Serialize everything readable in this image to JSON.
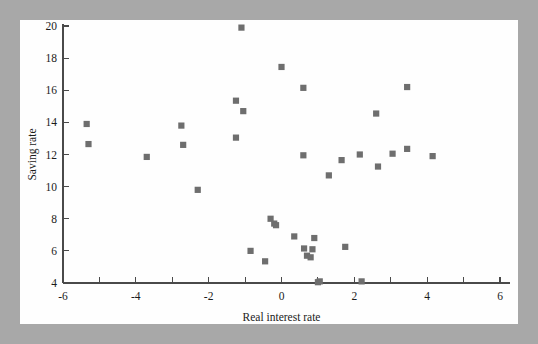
{
  "figure": {
    "background_color": "#a8a8a8",
    "card_color": "#fefefe",
    "marker_color": "#6e6e6e",
    "axis_color": "#4a4a4a"
  },
  "chart_data": {
    "type": "scatter",
    "title": "",
    "xlabel": "Real interest rate",
    "ylabel": "Saving rate",
    "xlim": [
      -6,
      6
    ],
    "ylim": [
      4,
      20
    ],
    "xticks": [
      -6,
      -4,
      -2,
      0,
      2,
      4,
      6
    ],
    "xtick_labels": [
      "-6",
      "-4",
      "-2",
      "0",
      "2",
      "4",
      "6"
    ],
    "yticks": [
      4,
      6,
      8,
      10,
      12,
      14,
      16,
      18,
      20
    ],
    "ytick_labels": [
      "4",
      "6",
      "8",
      "10",
      "12",
      "14",
      "16",
      "18",
      "20"
    ],
    "x_minor_tick_step": 1,
    "grid": false,
    "legend": null,
    "marker": "square",
    "points": [
      {
        "x": -5.35,
        "y": 13.9
      },
      {
        "x": -5.3,
        "y": 12.65
      },
      {
        "x": -3.7,
        "y": 11.85
      },
      {
        "x": -2.75,
        "y": 13.8
      },
      {
        "x": -2.7,
        "y": 12.6
      },
      {
        "x": -2.3,
        "y": 9.8
      },
      {
        "x": -1.25,
        "y": 15.35
      },
      {
        "x": -1.25,
        "y": 13.05
      },
      {
        "x": -1.1,
        "y": 19.9
      },
      {
        "x": -1.05,
        "y": 14.7
      },
      {
        "x": -0.85,
        "y": 6.0
      },
      {
        "x": -0.45,
        "y": 5.35
      },
      {
        "x": -0.3,
        "y": 8.0
      },
      {
        "x": -0.2,
        "y": 7.7
      },
      {
        "x": -0.15,
        "y": 7.6
      },
      {
        "x": 0.0,
        "y": 17.45
      },
      {
        "x": 0.35,
        "y": 6.9
      },
      {
        "x": 0.6,
        "y": 16.15
      },
      {
        "x": 0.6,
        "y": 11.95
      },
      {
        "x": 0.62,
        "y": 6.15
      },
      {
        "x": 0.7,
        "y": 5.7
      },
      {
        "x": 0.8,
        "y": 5.6
      },
      {
        "x": 0.85,
        "y": 6.1
      },
      {
        "x": 0.9,
        "y": 6.8
      },
      {
        "x": 1.0,
        "y": 4.05
      },
      {
        "x": 1.05,
        "y": 4.1
      },
      {
        "x": 1.3,
        "y": 10.7
      },
      {
        "x": 1.65,
        "y": 11.65
      },
      {
        "x": 1.75,
        "y": 6.25
      },
      {
        "x": 2.15,
        "y": 12.0
      },
      {
        "x": 2.2,
        "y": 4.1
      },
      {
        "x": 2.6,
        "y": 14.55
      },
      {
        "x": 2.65,
        "y": 11.25
      },
      {
        "x": 3.05,
        "y": 12.05
      },
      {
        "x": 3.45,
        "y": 16.2
      },
      {
        "x": 3.45,
        "y": 12.35
      },
      {
        "x": 4.15,
        "y": 11.9
      }
    ]
  }
}
